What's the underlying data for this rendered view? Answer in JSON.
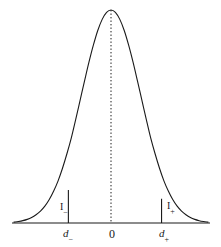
{
  "figure": {
    "name": "normal-distribution-two-tailed-critical-regions",
    "background_color": "#ffffff",
    "stroke_color": "#1a1a1a"
  },
  "axis": {
    "origin_label": "0",
    "left_critical_label_base": "d",
    "left_critical_label_sub": "−",
    "right_critical_label_base": "d",
    "right_critical_label_sub": "+"
  },
  "regions": {
    "left_tail_label_base": "I",
    "left_tail_label_sub": "−",
    "right_tail_label_base": "I",
    "right_tail_label_sub": "+"
  },
  "chart_data": {
    "type": "line",
    "title": "",
    "subtitle": "",
    "xlabel": "",
    "ylabel": "",
    "grid": false,
    "legend": null,
    "curve": "gaussian probability density",
    "xlim": [
      -3.3,
      3.3
    ],
    "ylim": [
      0,
      1
    ],
    "tick_labels": [
      "d−",
      "0",
      "d+"
    ],
    "tick_x_values": [
      -1.45,
      0,
      1.72
    ],
    "annotations": [
      {
        "text": "I−",
        "x": -1.45,
        "y": 0.1,
        "meaning": "left critical region"
      },
      {
        "text": "I+",
        "x": 1.72,
        "y": 0.1,
        "meaning": "right critical region"
      }
    ],
    "center_line": {
      "x": 0,
      "style": "dotted",
      "from_y": 0,
      "to_y": 1.0
    },
    "boundary_lines": [
      {
        "x": -1.45,
        "style": "solid",
        "from_y": 0,
        "to_y": 0.155
      },
      {
        "x": 1.72,
        "style": "solid",
        "from_y": 0,
        "to_y": 0.114
      }
    ],
    "x": [
      -3.3,
      -3.15,
      -3.0,
      -2.85,
      -2.7,
      -2.55,
      -2.4,
      -2.25,
      -2.1,
      -1.95,
      -1.8,
      -1.65,
      -1.5,
      -1.35,
      -1.2,
      -1.05,
      -0.9,
      -0.75,
      -0.6,
      -0.45,
      -0.3,
      -0.15,
      0.0,
      0.15,
      0.3,
      0.45,
      0.6,
      0.75,
      0.9,
      1.05,
      1.2,
      1.35,
      1.5,
      1.65,
      1.8,
      1.95,
      2.1,
      2.25,
      2.4,
      2.55,
      2.7,
      2.85,
      3.0,
      3.15,
      3.3
    ],
    "y": [
      0.004,
      0.007,
      0.011,
      0.017,
      0.026,
      0.039,
      0.056,
      0.079,
      0.11,
      0.15,
      0.198,
      0.257,
      0.325,
      0.4,
      0.487,
      0.577,
      0.667,
      0.755,
      0.835,
      0.904,
      0.956,
      0.989,
      1.0,
      0.989,
      0.956,
      0.904,
      0.835,
      0.755,
      0.667,
      0.577,
      0.487,
      0.4,
      0.325,
      0.257,
      0.198,
      0.15,
      0.11,
      0.079,
      0.056,
      0.039,
      0.026,
      0.017,
      0.011,
      0.007,
      0.004
    ]
  }
}
